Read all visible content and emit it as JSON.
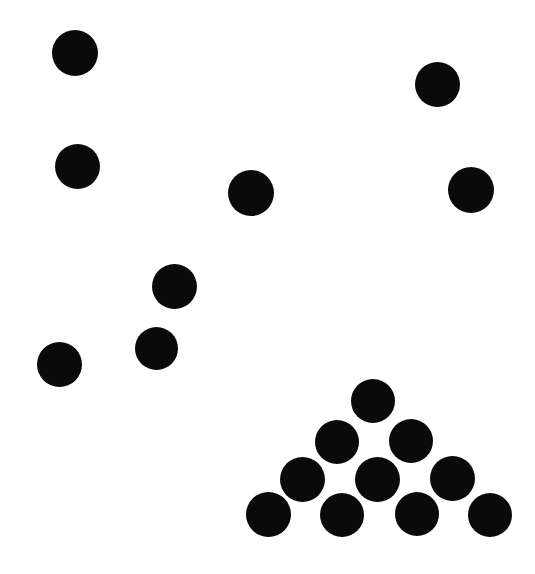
{
  "scene": {
    "title": "Black Dot Pattern",
    "width": 535,
    "height": 574,
    "background_color": "#ffffff",
    "dot_color": "#0a0a0a",
    "total_dots": 17
  },
  "chart_data": {
    "type": "scatter",
    "subtitle": "",
    "xlabel": "",
    "ylabel": "",
    "xlim": [
      0,
      535
    ],
    "ylim": [
      0,
      574
    ],
    "grid": false,
    "legend": "none",
    "axes_visible": false,
    "tick_labels_x": [],
    "tick_labels_y": [],
    "annotations": [],
    "marker": "filled-circle",
    "marker_color": "#0a0a0a",
    "series": [
      {
        "name": "scattered-dots",
        "count": 7,
        "points": [
          {
            "id": "dot-1",
            "cx": 75,
            "cy": 53,
            "d": 46
          },
          {
            "id": "dot-2",
            "cx": 77,
            "cy": 166,
            "d": 45
          },
          {
            "id": "dot-3",
            "cx": 437,
            "cy": 84,
            "d": 45
          },
          {
            "id": "dot-4",
            "cx": 251,
            "cy": 193,
            "d": 46
          },
          {
            "id": "dot-5",
            "cx": 471,
            "cy": 190,
            "d": 46
          },
          {
            "id": "dot-6",
            "cx": 174,
            "cy": 286,
            "d": 45
          },
          {
            "id": "dot-7",
            "cx": 156,
            "cy": 348,
            "d": 43
          },
          {
            "id": "dot-8",
            "cx": 59,
            "cy": 364,
            "d": 45
          }
        ]
      },
      {
        "name": "triangle-cluster",
        "count": 10,
        "rows": [
          1,
          2,
          3,
          4
        ],
        "points": [
          {
            "id": "cluster-r1-c1",
            "cx": 373,
            "cy": 401,
            "d": 44
          },
          {
            "id": "cluster-r2-c1",
            "cx": 337,
            "cy": 442,
            "d": 44
          },
          {
            "id": "cluster-r2-c2",
            "cx": 411,
            "cy": 441,
            "d": 44
          },
          {
            "id": "cluster-r3-c1",
            "cx": 302,
            "cy": 479,
            "d": 45
          },
          {
            "id": "cluster-r3-c2",
            "cx": 377,
            "cy": 479,
            "d": 45
          },
          {
            "id": "cluster-r3-c3",
            "cx": 452,
            "cy": 478,
            "d": 45
          },
          {
            "id": "cluster-r4-c1",
            "cx": 268,
            "cy": 514,
            "d": 45
          },
          {
            "id": "cluster-r4-c2",
            "cx": 342,
            "cy": 515,
            "d": 44
          },
          {
            "id": "cluster-r4-c3",
            "cx": 417,
            "cy": 514,
            "d": 44
          },
          {
            "id": "cluster-r4-c4",
            "cx": 490,
            "cy": 515,
            "d": 44
          }
        ]
      }
    ]
  }
}
